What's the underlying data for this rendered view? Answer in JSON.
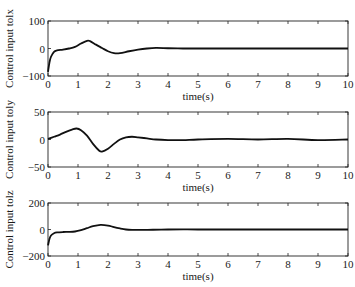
{
  "chart_data": [
    {
      "type": "line",
      "title": "",
      "xlabel": "time(s)",
      "ylabel": "Control input tolx",
      "xlim": [
        0,
        10
      ],
      "ylim": [
        -100,
        100
      ],
      "xticks": [
        0,
        1,
        2,
        3,
        4,
        5,
        6,
        7,
        8,
        9,
        10
      ],
      "yticks": [
        -100,
        0,
        100
      ],
      "ytick_labels": [
        "−100",
        "0",
        "100"
      ],
      "grid": false,
      "series": [
        {
          "name": "tolx",
          "x": [
            0,
            0.05,
            0.1,
            0.2,
            0.3,
            0.5,
            0.7,
            0.9,
            1.1,
            1.3,
            1.4,
            1.6,
            1.8,
            2.0,
            2.2,
            2.4,
            2.7,
            3.0,
            3.3,
            3.6,
            4.0,
            4.5,
            5,
            6,
            7,
            8,
            9,
            10
          ],
          "y": [
            -85,
            -50,
            -30,
            -12,
            -7,
            -4,
            0,
            6,
            18,
            28,
            27,
            14,
            2,
            -10,
            -17,
            -17,
            -10,
            -4,
            0,
            2,
            1,
            0,
            0,
            0,
            0,
            0,
            0,
            0
          ]
        }
      ]
    },
    {
      "type": "line",
      "title": "",
      "xlabel": "time(s)",
      "ylabel": "Control input toly",
      "xlim": [
        0,
        10
      ],
      "ylim": [
        -50,
        50
      ],
      "xticks": [
        0,
        1,
        2,
        3,
        4,
        5,
        6,
        7,
        8,
        9,
        10
      ],
      "yticks": [
        -50,
        0,
        50
      ],
      "ytick_labels": [
        "−50",
        "0",
        "50"
      ],
      "grid": false,
      "series": [
        {
          "name": "toly",
          "x": [
            0,
            0.2,
            0.4,
            0.6,
            0.8,
            0.95,
            1.1,
            1.3,
            1.5,
            1.7,
            1.8,
            2.0,
            2.2,
            2.4,
            2.6,
            2.8,
            3.0,
            3.3,
            3.6,
            4.0,
            4.5,
            5,
            6,
            7,
            8,
            9,
            10
          ],
          "y": [
            1,
            5,
            9,
            14,
            18,
            20,
            17,
            7,
            -8,
            -20,
            -22,
            -17,
            -8,
            0,
            4,
            5,
            4,
            2,
            0,
            -1,
            -1,
            0,
            1,
            0,
            1,
            -1,
            0
          ]
        }
      ]
    },
    {
      "type": "line",
      "title": "",
      "xlabel": "time(s)",
      "ylabel": "Control input tolz",
      "xlim": [
        0,
        10
      ],
      "ylim": [
        -200,
        200
      ],
      "xticks": [
        0,
        1,
        2,
        3,
        4,
        5,
        6,
        7,
        8,
        9,
        10
      ],
      "yticks": [
        -200,
        0,
        200
      ],
      "ytick_labels": [
        "−200",
        "0",
        "200"
      ],
      "grid": false,
      "series": [
        {
          "name": "tolz",
          "x": [
            0,
            0.05,
            0.1,
            0.2,
            0.3,
            0.5,
            0.7,
            0.9,
            1.1,
            1.3,
            1.5,
            1.75,
            2.0,
            2.2,
            2.4,
            2.6,
            2.8,
            3.0,
            3.5,
            4.0,
            4.5,
            5,
            6,
            7,
            8,
            9,
            10
          ],
          "y": [
            -120,
            -70,
            -45,
            -28,
            -22,
            -19,
            -18,
            -15,
            -5,
            10,
            25,
            35,
            30,
            18,
            8,
            0,
            -3,
            -3,
            -2,
            0,
            1,
            0,
            0,
            0,
            0,
            0,
            0
          ]
        }
      ]
    }
  ],
  "colors": {
    "line": "#111111",
    "frame": "#222222",
    "background": "#ffffff"
  }
}
